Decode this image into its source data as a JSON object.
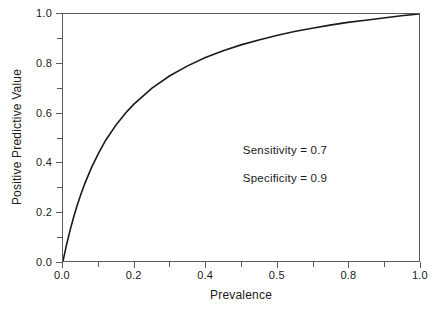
{
  "chart_data": {
    "type": "line",
    "title": "",
    "xlabel": "Prevalence",
    "ylabel": "Positive Predictive Value",
    "xlim": [
      0.0,
      1.0
    ],
    "ylim": [
      0.0,
      1.0
    ],
    "grid": false,
    "legend": null,
    "x_tick_labels": [
      "0.0",
      "0.2",
      "0.4",
      "0.5",
      "0.8",
      "1.0"
    ],
    "x_tick_values": [
      0.0,
      0.2,
      0.4,
      0.6,
      0.8,
      1.0
    ],
    "y_tick_labels": [
      "0.0",
      "0.2",
      "0.4",
      "0.6",
      "0.8",
      "1.0"
    ],
    "y_tick_values": [
      0.0,
      0.2,
      0.4,
      0.6,
      0.8,
      1.0
    ],
    "x_minor_ticks": [
      0.1,
      0.3,
      0.5,
      0.7,
      0.9
    ],
    "y_minor_ticks": [
      0.1,
      0.3,
      0.5,
      0.7,
      0.9
    ],
    "annotations": [
      "Sensitivity = 0.7",
      "Specificity = 0.9"
    ],
    "line_color": "#1a1a1a",
    "frame_color": "#5a5a5a",
    "series": [
      {
        "name": "Positive Predictive Value",
        "x": [
          0.0,
          0.01,
          0.02,
          0.03,
          0.04,
          0.05,
          0.06,
          0.08,
          0.1,
          0.12,
          0.15,
          0.18,
          0.2,
          0.25,
          0.3,
          0.35,
          0.4,
          0.45,
          0.5,
          0.55,
          0.6,
          0.65,
          0.7,
          0.75,
          0.8,
          0.85,
          0.9,
          0.95,
          1.0
        ],
        "y": [
          0.0,
          0.066,
          0.125,
          0.178,
          0.226,
          0.269,
          0.309,
          0.378,
          0.437,
          0.489,
          0.553,
          0.606,
          0.636,
          0.7,
          0.75,
          0.79,
          0.824,
          0.851,
          0.875,
          0.895,
          0.913,
          0.929,
          0.942,
          0.955,
          0.966,
          0.975,
          0.984,
          0.993,
          1.0
        ]
      }
    ]
  },
  "axes": {
    "x_ticks": [
      {
        "label": "0.0",
        "value": 0.0
      },
      {
        "label": "0.2",
        "value": 0.2
      },
      {
        "label": "0.4",
        "value": 0.4
      },
      {
        "label": "0.5",
        "value": 0.6
      },
      {
        "label": "0.8",
        "value": 0.8
      },
      {
        "label": "1.0",
        "value": 1.0
      }
    ],
    "y_ticks": [
      {
        "label": "0.0",
        "value": 0.0
      },
      {
        "label": "0.2",
        "value": 0.2
      },
      {
        "label": "0.4",
        "value": 0.4
      },
      {
        "label": "0.6",
        "value": 0.6
      },
      {
        "label": "0.8",
        "value": 0.8
      },
      {
        "label": "1.0",
        "value": 1.0
      }
    ],
    "xlabel": "Prevalence",
    "ylabel": "Positive Predictive Value"
  },
  "annotations": {
    "sensitivity": "Sensitivity = 0.7",
    "specificity": "Specificity = 0.9"
  }
}
